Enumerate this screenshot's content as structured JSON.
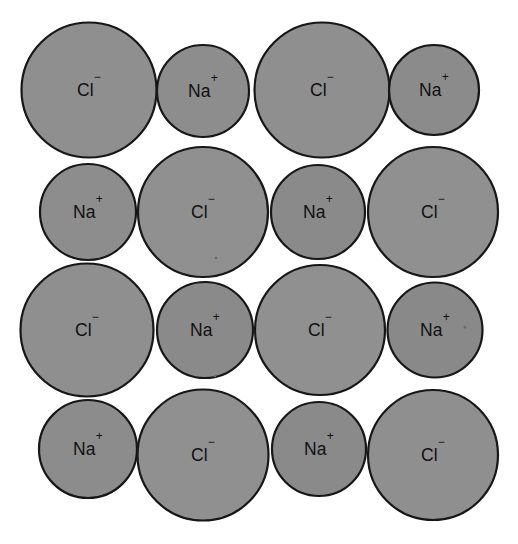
{
  "figure": {
    "background_color": "#ffffff",
    "outline_color": "#171717",
    "cation_label": "Na",
    "cation_charge": "+",
    "anion_label": "Cl",
    "anion_charge": "−",
    "cation_fill": "#8d8d8d",
    "anion_fill": "#909090",
    "rows": 4,
    "columns": 4
  },
  "ions": [
    {
      "id": "r1c1",
      "species": "chloride",
      "label": "Cl",
      "charge": "−",
      "cx": 89,
      "cy": 90,
      "r": 67.5,
      "fill": "#8f8f8f"
    },
    {
      "id": "r1c2",
      "species": "sodium",
      "label": "Na",
      "charge": "+",
      "cx": 203,
      "cy": 91,
      "r": 46.0,
      "fill": "#8d8d8d"
    },
    {
      "id": "r1c3",
      "species": "chloride",
      "label": "Cl",
      "charge": "−",
      "cx": 322,
      "cy": 90,
      "r": 67.5,
      "fill": "#8f8f8f"
    },
    {
      "id": "r1c4",
      "species": "sodium",
      "label": "Na",
      "charge": "+",
      "cx": 434,
      "cy": 90,
      "r": 45.0,
      "fill": "#8b8b8b"
    },
    {
      "id": "r2c1",
      "species": "sodium",
      "label": "Na",
      "charge": "+",
      "cx": 88,
      "cy": 212,
      "r": 48.0,
      "fill": "#8d8d8d"
    },
    {
      "id": "r2c2",
      "species": "chloride",
      "label": "Cl",
      "charge": "−",
      "cx": 203,
      "cy": 212,
      "r": 65.0,
      "fill": "#909090"
    },
    {
      "id": "r2c3",
      "species": "sodium",
      "label": "Na",
      "charge": "+",
      "cx": 318,
      "cy": 212,
      "r": 47.0,
      "fill": "#8a8a8a"
    },
    {
      "id": "r2c4",
      "species": "chloride",
      "label": "Cl",
      "charge": "−",
      "cx": 433,
      "cy": 212,
      "r": 65.0,
      "fill": "#909090"
    },
    {
      "id": "r3c1",
      "species": "chloride",
      "label": "Cl",
      "charge": "−",
      "cx": 87,
      "cy": 330,
      "r": 66.5,
      "fill": "#8f8f8f"
    },
    {
      "id": "r3c2",
      "species": "sodium",
      "label": "Na",
      "charge": "+",
      "cx": 205,
      "cy": 330,
      "r": 48.0,
      "fill": "#8a8a8a"
    },
    {
      "id": "r3c3",
      "species": "chloride",
      "label": "Cl",
      "charge": "−",
      "cx": 320,
      "cy": 330,
      "r": 65.0,
      "fill": "#909090"
    },
    {
      "id": "r3c4",
      "species": "sodium",
      "label": "Na",
      "charge": "+",
      "cx": 435,
      "cy": 330,
      "r": 47.5,
      "fill": "#898989"
    },
    {
      "id": "r4c1",
      "species": "sodium",
      "label": "Na",
      "charge": "+",
      "cx": 88,
      "cy": 449,
      "r": 49.0,
      "fill": "#8c8c8c"
    },
    {
      "id": "r4c2",
      "species": "chloride",
      "label": "Cl",
      "charge": "−",
      "cx": 203,
      "cy": 455,
      "r": 65.5,
      "fill": "#909090"
    },
    {
      "id": "r4c3",
      "species": "sodium",
      "label": "Na",
      "charge": "+",
      "cx": 319,
      "cy": 449,
      "r": 47.0,
      "fill": "#8a8a8a"
    },
    {
      "id": "r4c4",
      "species": "chloride",
      "label": "Cl",
      "charge": "−",
      "cx": 433,
      "cy": 455,
      "r": 65.0,
      "fill": "#8f8f8f"
    }
  ],
  "specks": [
    {
      "id": "speck-1",
      "cx": 465,
      "cy": 327,
      "r": 1.6
    },
    {
      "id": "speck-2",
      "cx": 216,
      "cy": 258,
      "r": 1.3
    },
    {
      "id": "speck-3",
      "cx": 215,
      "cy": 376,
      "r": 1.2
    }
  ]
}
